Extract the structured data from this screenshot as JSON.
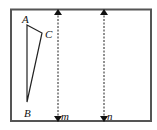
{
  "diagram": {
    "frame": {
      "x": 11,
      "y": 9,
      "width": 140,
      "height": 112,
      "stroke": "#555555"
    },
    "triangle": {
      "vertices": {
        "A": {
          "label": "A",
          "x": 27,
          "y": 25
        },
        "B": {
          "label": "B",
          "x": 27,
          "y": 102
        },
        "C": {
          "label": "C",
          "x": 42,
          "y": 33
        }
      }
    },
    "lines": [
      {
        "label": "m",
        "x": 58,
        "y1": 11,
        "y2": 120,
        "style": "dashed",
        "arrows": "both"
      },
      {
        "label": "n",
        "x": 104,
        "y1": 11,
        "y2": 120,
        "style": "dashed",
        "arrows": "both"
      }
    ]
  }
}
